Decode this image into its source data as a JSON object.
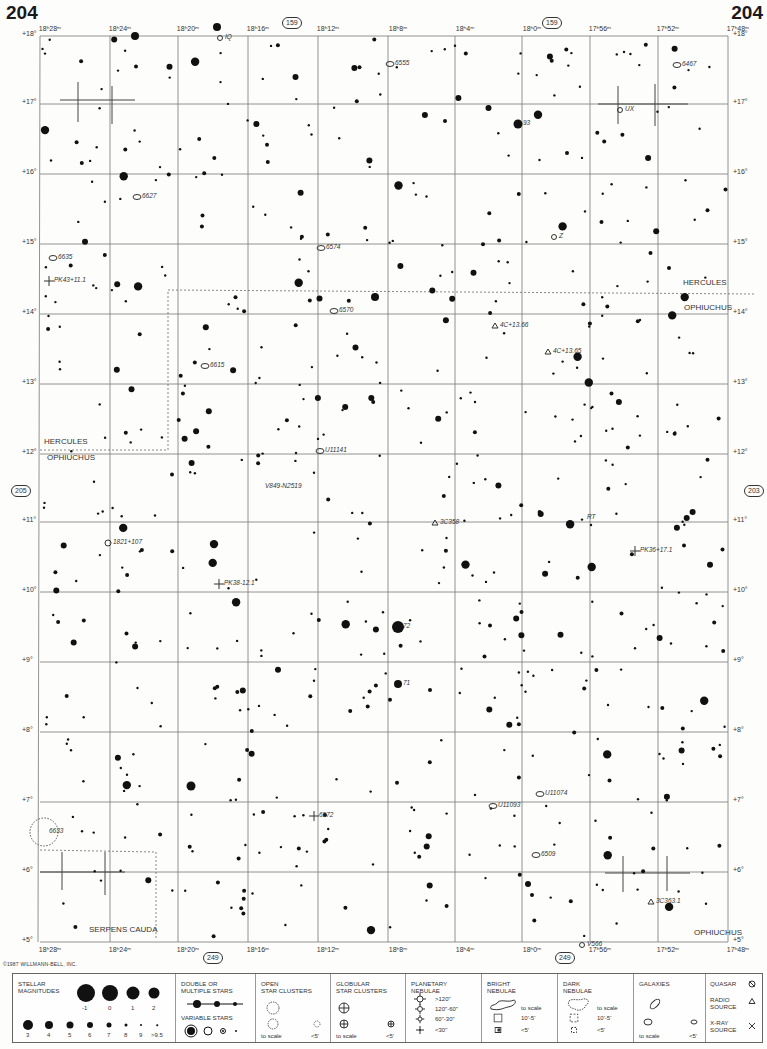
{
  "page": {
    "number_left": "204",
    "number_right": "204"
  },
  "adjacent_pages": {
    "top": "159",
    "bottom": "249",
    "left": "205",
    "right": "203"
  },
  "ra_labels_top": [
    "18ʰ28ᵐ",
    "18ʰ24ᵐ",
    "18ʰ20ᵐ",
    "18ʰ16ᵐ",
    "18ʰ12ᵐ",
    "18ʰ8ᵐ",
    "18ʰ4ᵐ",
    "18ʰ0ᵐ",
    "17ʰ56ᵐ",
    "17ʰ52ᵐ",
    "17ʰ48ᵐ"
  ],
  "ra_labels_bottom": [
    "18ʰ28ᵐ",
    "18ʰ24ᵐ",
    "18ʰ20ᵐ",
    "18ʰ16ᵐ",
    "18ʰ12ᵐ",
    "18ʰ8ᵐ",
    "18ʰ4ᵐ",
    "18ʰ0ᵐ",
    "17ʰ56ᵐ",
    "17ʰ52ᵐ",
    "17ʰ48ᵐ"
  ],
  "dec_labels": [
    "+18°",
    "+17°",
    "+16°",
    "+15°",
    "+14°",
    "+13°",
    "+12°",
    "+11°",
    "+10°",
    "+9°",
    "+8°",
    "+7°",
    "+6°",
    "+5°"
  ],
  "constellations": {
    "hercules_right": "HERCULES",
    "ophiuchus_right": "OPHIUCHUS",
    "hercules_left": "HERCULES",
    "ophiuchus_left": "OPHIUCHUS",
    "serpens": "SERPENS CAUDA",
    "ophiuchus_bottom": "OPHIUCHUS"
  },
  "objects": [
    {
      "label": "6555",
      "type": "galaxy",
      "x": 390,
      "y": 64
    },
    {
      "label": "6467",
      "type": "galaxy",
      "x": 677,
      "y": 65
    },
    {
      "label": "UX",
      "type": "variable",
      "x": 620,
      "y": 110
    },
    {
      "label": "93",
      "type": "star",
      "x": 518,
      "y": 124
    },
    {
      "label": "6627",
      "type": "galaxy",
      "x": 137,
      "y": 197
    },
    {
      "label": "6574",
      "type": "galaxy",
      "x": 321,
      "y": 248
    },
    {
      "label": "Z",
      "type": "variable",
      "x": 554,
      "y": 237
    },
    {
      "label": "6635",
      "type": "galaxy",
      "x": 53,
      "y": 258
    },
    {
      "label": "PK43+11.1",
      "type": "planetary",
      "x": 49,
      "y": 281
    },
    {
      "label": "6570",
      "type": "galaxy",
      "x": 334,
      "y": 311
    },
    {
      "label": "4C+13.66",
      "type": "radio",
      "x": 495,
      "y": 326
    },
    {
      "label": "4C+13.65",
      "type": "radio",
      "x": 548,
      "y": 352
    },
    {
      "label": "6615",
      "type": "galaxy",
      "x": 205,
      "y": 366
    },
    {
      "label": "U11141",
      "type": "galaxy",
      "x": 320,
      "y": 451
    },
    {
      "label": "V849-N2519",
      "type": "text",
      "x": 260,
      "y": 487
    },
    {
      "label": "3C358",
      "type": "radio",
      "x": 435,
      "y": 523
    },
    {
      "label": "RT",
      "type": "text",
      "x": 582,
      "y": 518
    },
    {
      "label": "1821+107",
      "type": "quasar",
      "x": 108,
      "y": 543
    },
    {
      "label": "PK36+17.1",
      "type": "planetary",
      "x": 635,
      "y": 551
    },
    {
      "label": "PK38-12.1",
      "type": "planetary",
      "x": 219,
      "y": 584
    },
    {
      "label": "72",
      "type": "star",
      "x": 398,
      "y": 627
    },
    {
      "label": "71",
      "type": "star",
      "x": 398,
      "y": 684
    },
    {
      "label": "U11074",
      "type": "galaxy",
      "x": 540,
      "y": 794
    },
    {
      "label": "U11093",
      "type": "galaxy",
      "x": 493,
      "y": 806
    },
    {
      "label": "6572",
      "type": "planetary",
      "x": 314,
      "y": 816
    },
    {
      "label": "6633",
      "type": "open_cluster",
      "x": 44,
      "y": 832
    },
    {
      "label": "6509",
      "type": "galaxy",
      "x": 536,
      "y": 855
    },
    {
      "label": "3C363.1",
      "type": "radio",
      "x": 651,
      "y": 902
    },
    {
      "label": "V566",
      "type": "variable",
      "x": 582,
      "y": 945
    },
    {
      "label": "IQ",
      "type": "variable",
      "x": 220,
      "y": 38
    }
  ],
  "copyright": "©1987 WILLMANN-BELL, INC.",
  "legend": {
    "stellar": {
      "title_1": "STELLAR",
      "title_2": "MAGNITUDES",
      "mags_top": [
        "-1",
        "0",
        "1",
        "2"
      ],
      "mags_bottom": [
        "3",
        "4",
        "5",
        "6",
        "7",
        "8",
        "9",
        ">9.5"
      ]
    },
    "double": {
      "title_1": "DOUBLE OR",
      "title_2": "MULTIPLE STARS",
      "variable_title": "VARIABLE STARS"
    },
    "open": {
      "title_1": "OPEN",
      "title_2": "STAR CLUSTERS",
      "scale": "to scale",
      "small": "<5'"
    },
    "globular": {
      "title_1": "GLOBULAR",
      "title_2": "STAR CLUSTERS",
      "scale": "to scale",
      "small": "<5'"
    },
    "planetary": {
      "title_1": "PLANETARY",
      "title_2": "NEBULAE",
      "sizes": [
        ">120\"",
        "120\"-60\"",
        "60\"-30\"",
        "<30\""
      ]
    },
    "bright": {
      "title_1": "BRIGHT",
      "title_2": "NEBULAE",
      "scale": "to scale",
      "mid": "10'-5'",
      "small": "<5'"
    },
    "dark": {
      "title_1": "DARK",
      "title_2": "NEBULAE",
      "scale": "to scale",
      "mid": "10'-5'",
      "small": "<5'"
    },
    "galaxies": {
      "title": "GALAXIES",
      "scale": "to scale",
      "small": "<5'"
    },
    "other": {
      "quasar": "QUASAR",
      "radio_1": "RADIO",
      "radio_2": "SOURCE",
      "xray_1": "X-RAY",
      "xray_2": "SOURCE"
    }
  }
}
